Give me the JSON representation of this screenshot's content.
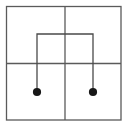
{
  "canvas": {
    "width": 131,
    "height": 130,
    "background": "#ffffff",
    "title": "four-quadrant grid with bracket and two terminal dots"
  },
  "style": {
    "grid_line_color": "#5a5a5a",
    "bracket_line_color": "#4a4a4a",
    "dot_fill_color": "#171717",
    "grid_line_width": 1.3,
    "bracket_line_width": 1.3
  },
  "chart_data": {
    "type": "diagram",
    "title": "",
    "xlabel": "",
    "ylabel": "",
    "outer_square": {
      "label": "outer-square",
      "x1": 6.5,
      "y1": 6.5,
      "x2": 121.0,
      "y2": 120.0
    },
    "dividers": [
      {
        "label": "vertical-divider",
        "orientation": "vertical",
        "x1": 65.0,
        "y1": 6.5,
        "x2": 65.0,
        "y2": 120.0
      },
      {
        "label": "horizontal-divider",
        "orientation": "horizontal",
        "x1": 6.5,
        "y1": 63.5,
        "x2": 121.0,
        "y2": 63.5
      }
    ],
    "bracket": {
      "label": "inverted-u-bracket",
      "points": [
        [
          37.0,
          92.0
        ],
        [
          37.0,
          34.0
        ],
        [
          93.0,
          34.0
        ],
        [
          93.0,
          92.0
        ]
      ],
      "top_y": 34.0,
      "left_x": 37.0,
      "right_x": 93.0,
      "bottom_y": 92.0
    },
    "dots": [
      {
        "label": "left-terminal-dot",
        "cx": 37.0,
        "cy": 92.0,
        "r": 4.1,
        "quadrant": "lower-left"
      },
      {
        "label": "right-terminal-dot",
        "cx": 93.0,
        "cy": 92.0,
        "r": 4.1,
        "quadrant": "lower-right"
      }
    ],
    "quadrants": [
      {
        "label": "upper-left",
        "x1": 6.5,
        "y1": 6.5,
        "x2": 65.0,
        "y2": 63.5
      },
      {
        "label": "upper-right",
        "x1": 65.0,
        "y1": 6.5,
        "x2": 121.0,
        "y2": 63.5
      },
      {
        "label": "lower-left",
        "x1": 6.5,
        "y1": 63.5,
        "x2": 65.0,
        "y2": 120.0
      },
      {
        "label": "lower-right",
        "x1": 65.0,
        "y1": 63.5,
        "x2": 121.0,
        "y2": 120.0
      }
    ]
  }
}
